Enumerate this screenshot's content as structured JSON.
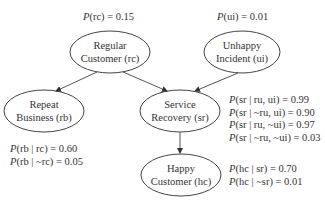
{
  "nodes": {
    "rc": {
      "line1": "Regular",
      "line2": "Customer (rc)"
    },
    "ui": {
      "line1": "Unhappy",
      "line2": "Incident (ui)"
    },
    "rb": {
      "line1": "Repeat",
      "line2": "Business (rb)"
    },
    "sr": {
      "line1": "Service",
      "line2": "Recovery (sr)"
    },
    "hc": {
      "line1": "Happy",
      "line2": "Customer (hc)"
    }
  },
  "probabilities": {
    "rc": [
      {
        "p": "P",
        "expr": "(rc) = 0.15"
      }
    ],
    "ui": [
      {
        "p": "P",
        "expr": "(ui) = 0.01"
      }
    ],
    "rb": [
      {
        "p": "P",
        "expr": "(rb | rc) = 0.60"
      },
      {
        "p": "P",
        "expr": "(rb | ~rc) = 0.05"
      }
    ],
    "sr": [
      {
        "p": "P",
        "expr": "(sr | ru, ui) = 0.99"
      },
      {
        "p": "P",
        "expr": "(sr | ~ru, ui) = 0.90"
      },
      {
        "p": "P",
        "expr": "(sr | ru, ~ui) = 0.97"
      },
      {
        "p": "P",
        "expr": "(sr | ~ru, ~ui) = 0.03"
      }
    ],
    "hc": [
      {
        "p": "P",
        "expr": "(hc | sr) = 0.70"
      },
      {
        "p": "P",
        "expr": "(hc | ~sr) = 0.01"
      }
    ]
  },
  "edges": [
    {
      "from": "rc",
      "to": "rb"
    },
    {
      "from": "rc",
      "to": "sr"
    },
    {
      "from": "ui",
      "to": "sr"
    },
    {
      "from": "sr",
      "to": "hc"
    }
  ],
  "colors": {
    "stroke": "#444444",
    "text": "#333333",
    "background": "#ffffff"
  }
}
